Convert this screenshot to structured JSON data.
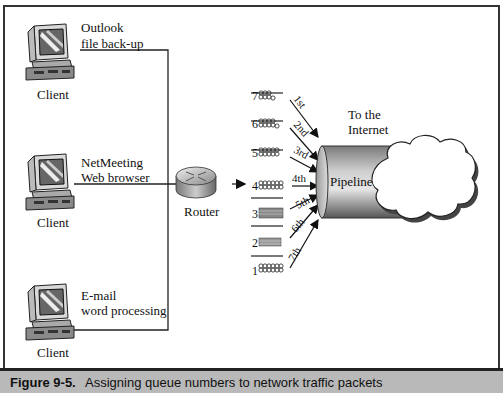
{
  "figure": {
    "number": "Figure 9-5.",
    "caption": "Assigning queue numbers to network traffic packets"
  },
  "clients": [
    {
      "label": "Client",
      "app_lines": [
        "Outlook",
        "file back-up"
      ]
    },
    {
      "label": "Client",
      "app_lines": [
        "NetMeeting",
        "Web browser"
      ]
    },
    {
      "label": "Client",
      "app_lines": [
        "E-mail",
        "word processing"
      ]
    }
  ],
  "router": {
    "label": "Router"
  },
  "queues": [
    {
      "number": "7",
      "order": "1st"
    },
    {
      "number": "6",
      "order": "2nd"
    },
    {
      "number": "5",
      "order": "3rd"
    },
    {
      "number": "4",
      "order": "4th"
    },
    {
      "number": "3",
      "order": "5th"
    },
    {
      "number": "2",
      "order": "6th"
    },
    {
      "number": "1",
      "order": "7th"
    }
  ],
  "pipeline": {
    "label": "Pipeline"
  },
  "internet": {
    "label_lines": [
      "To the",
      "Internet"
    ]
  },
  "colors": {
    "frame": "#333333",
    "caption_bar": "#b9b9b9",
    "pipe_dark": "#6e6e6e",
    "pipe_light": "#d8d8d8"
  }
}
